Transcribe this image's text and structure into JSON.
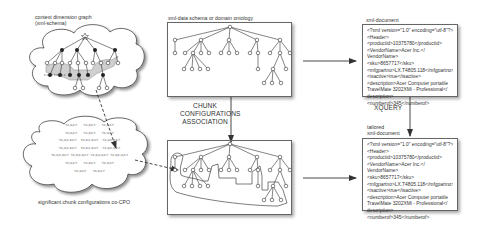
{
  "diagram": {
    "context_graph": {
      "label_line1": "context dimension graph",
      "label_line2": "(xml-schema)"
    },
    "chunk_cloud": {
      "label": "significant chunk configurations co-CPO",
      "rows": [
        [
          "<c,v,c>",
          "<c,v,c>",
          "<c,v,c>"
        ],
        [
          "<c,v,c>",
          "<c,v,c>",
          "<c,v,c>"
        ],
        [
          "<c,v,c,v,c>",
          "<c,v,c,v,c>",
          "<c,v,c,v,c>"
        ],
        [
          "<c,v,c,v,c>",
          "<c,v,c,v,c>",
          "<c,v,c,v,c>"
        ],
        [
          "<c,v,c,v,c>",
          "<c,v,c,v,c>",
          "<c,v,c,v,c>",
          "<c,v,c,v,c>"
        ],
        [
          "<c,v,c>",
          "<c,v,c>",
          "<c,v,c>"
        ],
        [
          "<c,v,c>",
          "<c,v,c>"
        ]
      ]
    },
    "schema_box": {
      "label": "xml-data schema or domain ontology"
    },
    "association": {
      "line1": "CHUNK",
      "line2": "CONFIGURATIONS",
      "line3": "ASSOCIATION"
    },
    "xquery": {
      "label": "XQUERY"
    },
    "xml_document": {
      "label": "xml-document",
      "lines": [
        "<?xml version=\"1.0\" encoding=\"utf-8\"?>",
        "<Header>",
        "<productid>10375780</productid>",
        "<VendorName>Acer Inc.</",
        "VendorName>",
        "<sku>8657717</sku>",
        "<mfgpartno>LX.T4805.118</mfgpartno>",
        "<isactive>true</isactive>",
        "<description>Acer Computer portatile",
        "TravelMate 3202XMi - Professional</",
        "description>",
        "<numberof>345</numberof>"
      ]
    },
    "tailored_document": {
      "label_line1": "tailored",
      "label_line2": "xml-document",
      "lines": [
        "<?xml version=\"1.0\" encoding=\"utf-8\"?>",
        "<Header>",
        "<productid>10375780</productid>",
        "<VendorName>Acer Inc.</",
        "VendorName>",
        "<sku>8657717</sku>",
        "<mfgpartno>LX.T4805.118</mfgpartno>",
        "<isactive>true</isactive>",
        "<description>Acer Computer portatile",
        "TravelMate 3202XMi - Professional</",
        "description>",
        "<numberof>345</numberof>"
      ]
    },
    "colors": {
      "line": "#333333",
      "box_border": "#666666",
      "highlight_region": "#d9d9d9",
      "filled_node": "#222222"
    }
  }
}
